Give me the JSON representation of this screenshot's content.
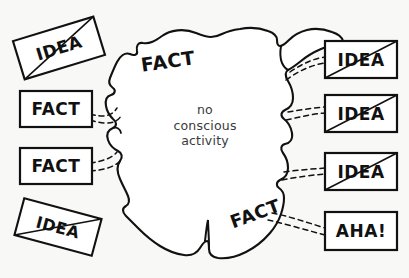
{
  "figure": {
    "background_color": "#f8f8f6",
    "ink_color": "#111111",
    "note_color": "#3a3a3a"
  },
  "blob": {
    "name": "brain-blob",
    "center_note_lines": [
      "no",
      "conscious",
      "activity"
    ],
    "labels": [
      {
        "text": "FACT",
        "position": "upper-left-of-blob",
        "rotation": -8
      },
      {
        "text": "FACT",
        "position": "lower-right-of-blob",
        "rotation": -20
      }
    ]
  },
  "inputs": [
    {
      "id": "input-idea-top-left",
      "text": "IDEA",
      "rotation": -17,
      "struck": true,
      "connected": false
    },
    {
      "id": "input-fact-upper-left",
      "text": "FACT",
      "rotation": 0,
      "struck": false,
      "connected": true
    },
    {
      "id": "input-fact-lower-left",
      "text": "FACT",
      "rotation": 0,
      "struck": false,
      "connected": true
    },
    {
      "id": "input-idea-bottom-left",
      "text": "IDEA",
      "rotation": 15,
      "struck": true,
      "connected": false
    }
  ],
  "outputs": [
    {
      "id": "output-idea-1",
      "text": "IDEA",
      "struck": true,
      "connected": true
    },
    {
      "id": "output-idea-2",
      "text": "IDEA",
      "struck": true,
      "connected": true
    },
    {
      "id": "output-idea-3",
      "text": "IDEA",
      "struck": true,
      "connected": true
    },
    {
      "id": "output-aha",
      "text": "AHA!",
      "struck": false,
      "connected": true
    }
  ]
}
